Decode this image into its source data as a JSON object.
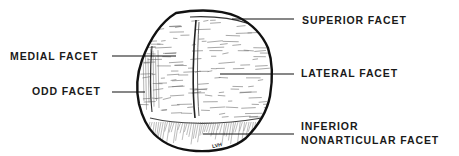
{
  "diagram": {
    "labels": {
      "superior": "SUPERIOR FACET",
      "medial": "MEDIAL FACET",
      "lateral": "LATERAL FACET",
      "odd": "ODD FACET",
      "inferior_line1": "INFERIOR",
      "inferior_line2": "NONARTICULAR FACET"
    },
    "signature": "LVH",
    "colors": {
      "ink": "#1a1a1a",
      "background": "#ffffff"
    }
  }
}
